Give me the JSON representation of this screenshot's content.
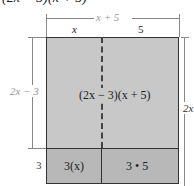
{
  "title": "(2x − 3)(x + 5)",
  "top_dimension": {
    "label": "x + 5"
  },
  "column_labels": [
    "x",
    "5"
  ],
  "left_dimensions": [
    {
      "label": "2x − 3"
    },
    {
      "label": "3"
    }
  ],
  "right_dimension": {
    "label": "2x"
  },
  "regions": {
    "main": "(2x − 3)(x + 5)",
    "bottom_left": "3(x)",
    "bottom_right": "3 • 5"
  },
  "colors": {
    "main_fill": "#c8c8c8",
    "bottom_fill": "#b8b8b8",
    "border": "#333333",
    "dim_line": "#888888"
  }
}
